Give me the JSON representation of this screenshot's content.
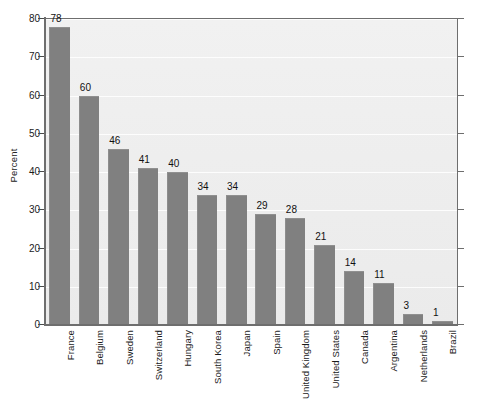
{
  "chart_data": {
    "type": "bar",
    "title": "",
    "subtitle": "",
    "xlabel": "",
    "ylabel": "Percent",
    "ylim": [
      0,
      80
    ],
    "yticks": [
      0,
      10,
      20,
      30,
      40,
      50,
      60,
      70,
      80
    ],
    "ytick_labels": [
      "0",
      "10",
      "20",
      "30",
      "40",
      "50",
      "60",
      "70",
      "80"
    ],
    "grid": true,
    "grid_axis": "y",
    "legend": false,
    "legend_position": "none",
    "orientation": "vertical",
    "data_labels": true,
    "categories": [
      "France",
      "Belgium",
      "Sweden",
      "Switzerland",
      "Hungary",
      "South Korea",
      "Japan",
      "Spain",
      "United Kingdom",
      "United States",
      "Canada",
      "Argentina",
      "Netherlands",
      "Brazil"
    ],
    "values": [
      78,
      60,
      46,
      41,
      40,
      34,
      34,
      29,
      28,
      21,
      14,
      11,
      3,
      1
    ],
    "value_labels": [
      "78",
      "60",
      "46",
      "41",
      "40",
      "34",
      "34",
      "29",
      "28",
      "21",
      "14",
      "11",
      "3",
      "1"
    ],
    "colors": {
      "bar_fill": "#808080",
      "plot_background": "#eeeeee",
      "page_background": "#ffffff",
      "axis_line": "#6e6e6e",
      "gridline": "#ffffff",
      "text": "#111111"
    }
  }
}
